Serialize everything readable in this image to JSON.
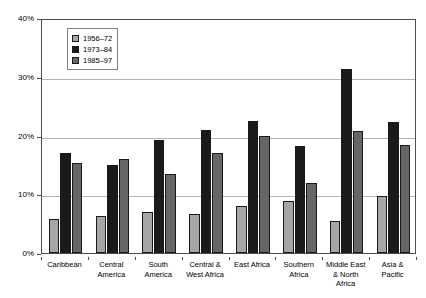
{
  "chart_data": {
    "type": "bar",
    "title": "",
    "subtitle": "",
    "xlabel": "",
    "ylabel": "",
    "ylim": [
      0,
      40
    ],
    "y_ticks": [
      "0%",
      "10%",
      "20%",
      "30%",
      "40%"
    ],
    "y_tick_values": [
      0,
      10,
      20,
      30,
      40
    ],
    "grid": true,
    "legend_position": "top-left inside plot",
    "categories": [
      "Caribbean",
      "Central America",
      "South America",
      "Central & West Africa",
      "East Africa",
      "Southern Africa",
      "Middle East & North Africa",
      "Asia & Pacific"
    ],
    "category_label_lines": [
      [
        "Caribbean"
      ],
      [
        "Central",
        "America"
      ],
      [
        "South",
        "America"
      ],
      [
        "Central &",
        "West Africa"
      ],
      [
        "East Africa"
      ],
      [
        "Southern",
        "Africa"
      ],
      [
        "Middle East",
        "& North",
        "Africa"
      ],
      [
        "Asia &",
        "Pacific"
      ]
    ],
    "series": [
      {
        "name": "1956–72",
        "color": "#a6a6a6",
        "values": [
          5.8,
          6.3,
          7.0,
          6.6,
          8.0,
          8.9,
          5.4,
          9.7
        ]
      },
      {
        "name": "1973–84",
        "color": "#1a1a1a",
        "values": [
          17.0,
          14.9,
          19.2,
          21.0,
          22.4,
          18.2,
          31.4,
          22.3
        ]
      },
      {
        "name": "1985–97",
        "color": "#666666",
        "values": [
          15.3,
          16.0,
          13.5,
          17.1,
          19.9,
          11.9,
          20.7,
          18.4
        ]
      }
    ]
  },
  "legend": {
    "entries": [
      {
        "label": "1956–72",
        "color": "#a6a6a6"
      },
      {
        "label": "1973–84",
        "color": "#1a1a1a"
      },
      {
        "label": "1985–97",
        "color": "#666666"
      }
    ]
  },
  "colors": {
    "series_1": "#a6a6a6",
    "series_2": "#1a1a1a",
    "series_3": "#666666",
    "gridline": "#b3b3b3",
    "axis": "#4d4d4d",
    "background": "#ffffff",
    "text": "#000000"
  }
}
